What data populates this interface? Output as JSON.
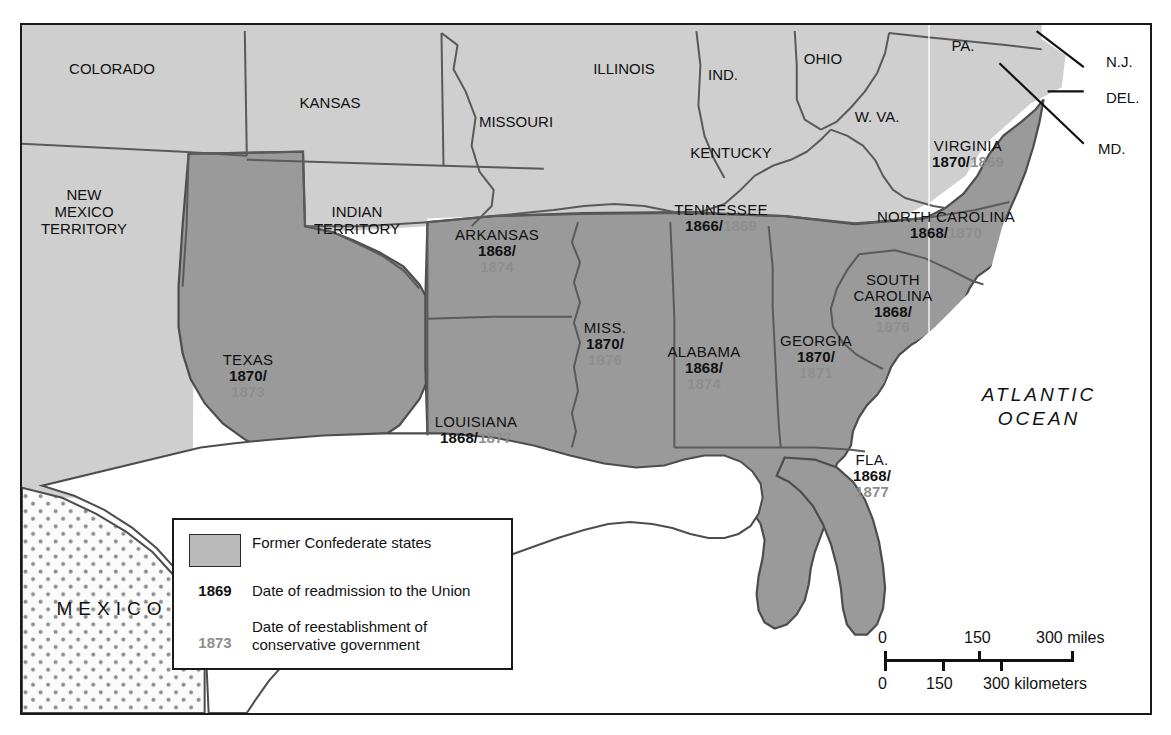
{
  "map": {
    "title": "Reconstruction of the South",
    "ocean_label": [
      "ATLANTIC",
      "OCEAN"
    ],
    "mexico_label": "MEXICO",
    "colors": {
      "confederate_fill": "#9a9a9a",
      "union_fill": "#cfcfcf",
      "water_fill": "#ffffff",
      "mexico_fill": "#fbfbfb",
      "border": "#555555",
      "frame": "#1a1a1a",
      "gray_date": "#8e8e8e",
      "black_date": "#111111"
    },
    "confederate_states": [
      {
        "name": "VIRGINIA",
        "readmission": "1870",
        "conservative": "1869",
        "x": 968,
        "y": 138,
        "layout": "inline"
      },
      {
        "name": "NORTH CAROLINA",
        "readmission": "1868",
        "conservative": "1870",
        "x": 946,
        "y": 209,
        "layout": "inline"
      },
      {
        "name": "SOUTH CAROLINA",
        "readmission": "1868",
        "conservative": "1876",
        "x": 893,
        "y": 272,
        "layout": "stacked-two-line-name"
      },
      {
        "name": "GEORGIA",
        "readmission": "1870",
        "conservative": "1871",
        "x": 816,
        "y": 333,
        "layout": "stacked"
      },
      {
        "name": "FLA.",
        "readmission": "1868",
        "conservative": "1877",
        "x": 872,
        "y": 452,
        "layout": "stacked"
      },
      {
        "name": "ALABAMA",
        "readmission": "1868",
        "conservative": "1874",
        "x": 704,
        "y": 344,
        "layout": "stacked"
      },
      {
        "name": "MISS.",
        "readmission": "1870",
        "conservative": "1876",
        "x": 605,
        "y": 320,
        "layout": "stacked"
      },
      {
        "name": "TENNESSEE",
        "readmission": "1866",
        "conservative": "1869",
        "x": 721,
        "y": 202,
        "layout": "inline"
      },
      {
        "name": "ARKANSAS",
        "readmission": "1868",
        "conservative": "1874",
        "x": 497,
        "y": 227,
        "layout": "stacked"
      },
      {
        "name": "LOUISIANA",
        "readmission": "1868",
        "conservative": "1877",
        "x": 476,
        "y": 414,
        "layout": "inline"
      },
      {
        "name": "TEXAS",
        "readmission": "1870",
        "conservative": "1873",
        "x": 248,
        "y": 352,
        "layout": "stacked"
      }
    ],
    "union_states": [
      {
        "name": "COLORADO",
        "x": 112,
        "y": 60,
        "size": "normal"
      },
      {
        "name": "KANSAS",
        "x": 330,
        "y": 94,
        "size": "normal"
      },
      {
        "name": "NEW\nMEXICO\nTERRITORY",
        "x": 84,
        "y": 186,
        "size": "normal"
      },
      {
        "name": "INDIAN\nTERRITORY",
        "x": 357,
        "y": 203,
        "size": "normal"
      },
      {
        "name": "MISSOURI",
        "x": 516,
        "y": 113,
        "size": "normal"
      },
      {
        "name": "ILLINOIS",
        "x": 624,
        "y": 60,
        "size": "normal"
      },
      {
        "name": "IND.",
        "x": 723,
        "y": 66,
        "size": "normal"
      },
      {
        "name": "OHIO",
        "x": 823,
        "y": 50,
        "size": "normal"
      },
      {
        "name": "KENTUCKY",
        "x": 731,
        "y": 144,
        "size": "normal"
      },
      {
        "name": "W. VA.",
        "x": 877,
        "y": 108,
        "size": "normal"
      },
      {
        "name": "PA.",
        "x": 963,
        "y": 37,
        "size": "normal"
      }
    ],
    "callout_labels": [
      {
        "name": "N.J.",
        "x": 1106,
        "y": 53
      },
      {
        "name": "DEL.",
        "x": 1106,
        "y": 89
      },
      {
        "name": "MD.",
        "x": 1098,
        "y": 140
      }
    ]
  },
  "legend": {
    "swatch_label": "Former Confederate states",
    "date_black": "1869",
    "date_black_label": "Date of readmission to the Union",
    "date_gray": "1873",
    "date_gray_label_line1": "Date of reestablishment of",
    "date_gray_label_line2": "conservative government"
  },
  "scale": {
    "miles": {
      "start": "0",
      "mid": "150",
      "end": "300 miles"
    },
    "kilometers": {
      "start": "0",
      "mid": "150",
      "end": "300 kilometers"
    }
  }
}
